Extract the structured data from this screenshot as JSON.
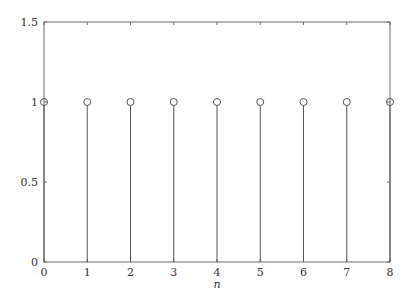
{
  "chart_data": {
    "type": "stem",
    "title": "",
    "xlabel": "n",
    "ylabel": "",
    "x": [
      0,
      1,
      2,
      3,
      4,
      5,
      6,
      7,
      8
    ],
    "values": [
      1,
      1,
      1,
      1,
      1,
      1,
      1,
      1,
      1
    ],
    "xlim": [
      0,
      8
    ],
    "ylim": [
      0,
      1.5
    ],
    "xticks": [
      0,
      1,
      2,
      3,
      4,
      5,
      6,
      7,
      8
    ],
    "xtick_labels": [
      "0",
      "1",
      "2",
      "3",
      "4",
      "5",
      "6",
      "7",
      "8"
    ],
    "yticks": [
      0,
      0.5,
      1,
      1.5
    ],
    "ytick_labels": [
      "0",
      "0.5",
      "1",
      "1.5"
    ],
    "marker": "open-circle",
    "grid": false,
    "box": true,
    "colors": {
      "line": "#555555",
      "axis": "#6a6a6a",
      "text": "#333333"
    }
  }
}
